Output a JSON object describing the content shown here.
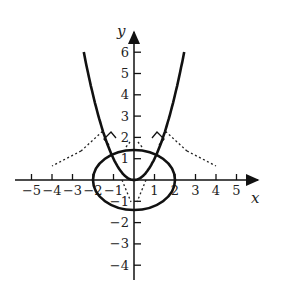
{
  "figure": {
    "axes": {
      "x_label": "x",
      "y_label": "y",
      "x_ticks": [
        {
          "value": -5,
          "label": "−5"
        },
        {
          "value": -4,
          "label": "−4"
        },
        {
          "value": -3,
          "label": "−3"
        },
        {
          "value": -2,
          "label": "−2"
        },
        {
          "value": -1,
          "label": "−1"
        },
        {
          "value": 1,
          "label": "1"
        },
        {
          "value": 2,
          "label": "2"
        },
        {
          "value": 3,
          "label": "3"
        },
        {
          "value": 4,
          "label": "4"
        },
        {
          "value": 5,
          "label": "5"
        }
      ],
      "y_ticks": [
        {
          "value": 6,
          "label": "6"
        },
        {
          "value": 5,
          "label": "5"
        },
        {
          "value": 4,
          "label": "4"
        },
        {
          "value": 3,
          "label": "3"
        },
        {
          "value": 2,
          "label": "2"
        },
        {
          "value": 1,
          "label": "1"
        },
        {
          "value": -1,
          "label": "−1"
        },
        {
          "value": -2,
          "label": "−2"
        },
        {
          "value": -3,
          "label": "−3"
        },
        {
          "value": -4,
          "label": "−4"
        }
      ]
    },
    "curves": [
      {
        "name": "parabola",
        "equation": "y = x^2",
        "style": "solid"
      },
      {
        "name": "ellipse",
        "equation": "x^2/4 + y^2/2 = 1",
        "style": "solid"
      },
      {
        "name": "tangent-lines",
        "style": "dotted"
      },
      {
        "name": "right-angle-markers",
        "count": 2
      }
    ]
  }
}
